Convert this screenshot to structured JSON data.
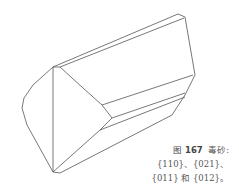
{
  "figure": {
    "stroke_color": "#555555",
    "polylines": [
      [
        [
          53,
          67
        ],
        [
          33,
          85
        ],
        [
          24,
          98
        ],
        [
          22,
          108
        ],
        [
          27,
          125
        ],
        [
          53,
          172
        ]
      ],
      [
        [
          53,
          67
        ],
        [
          53,
          172
        ]
      ],
      [
        [
          60,
          67
        ],
        [
          83,
          88
        ],
        [
          102,
          105
        ],
        [
          112,
          118
        ],
        [
          100,
          130
        ],
        [
          53,
          172
        ]
      ],
      [
        [
          53,
          67
        ],
        [
          60,
          67
        ]
      ],
      [
        [
          53,
          67
        ],
        [
          178,
          14
        ]
      ],
      [
        [
          60,
          67
        ],
        [
          184,
          18
        ]
      ],
      [
        [
          178,
          14
        ],
        [
          185,
          17
        ]
      ],
      [
        [
          185,
          17
        ],
        [
          195,
          75
        ],
        [
          185,
          95
        ],
        [
          172,
          115
        ]
      ],
      [
        [
          102,
          105
        ],
        [
          193,
          75
        ]
      ],
      [
        [
          112,
          118
        ],
        [
          185,
          93
        ]
      ],
      [
        [
          100,
          130
        ],
        [
          185,
          97
        ]
      ],
      [
        [
          60,
          173
        ],
        [
          172,
          115
        ]
      ],
      [
        [
          53,
          172
        ],
        [
          60,
          173
        ]
      ]
    ]
  },
  "caption": {
    "label": "图",
    "number": "167",
    "mineral": "毒砂:",
    "line2": "{110}、{021}、",
    "line3": "{011} 和 {012}。"
  }
}
